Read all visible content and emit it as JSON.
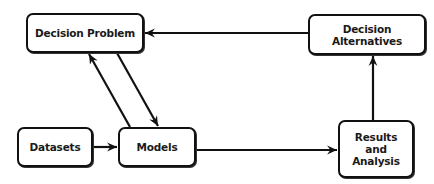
{
  "diagram": {
    "type": "flowchart",
    "nodes": [
      {
        "id": "decision_problem",
        "label": "Decision Problem"
      },
      {
        "id": "decision_alternatives",
        "label": "Decision\nAlternatives"
      },
      {
        "id": "datasets",
        "label": "Datasets"
      },
      {
        "id": "models",
        "label": "Models"
      },
      {
        "id": "results_analysis",
        "label": "Results\nand\nAnalysis"
      }
    ],
    "edges": [
      {
        "from": "datasets",
        "to": "models"
      },
      {
        "from": "models",
        "to": "decision_problem"
      },
      {
        "from": "decision_problem",
        "to": "models"
      },
      {
        "from": "models",
        "to": "results_analysis"
      },
      {
        "from": "results_analysis",
        "to": "decision_alternatives"
      },
      {
        "from": "decision_alternatives",
        "to": "decision_problem"
      }
    ],
    "colors": {
      "stroke": "#111111",
      "fill": "#ffffff",
      "text": "#1a1a1a"
    }
  }
}
